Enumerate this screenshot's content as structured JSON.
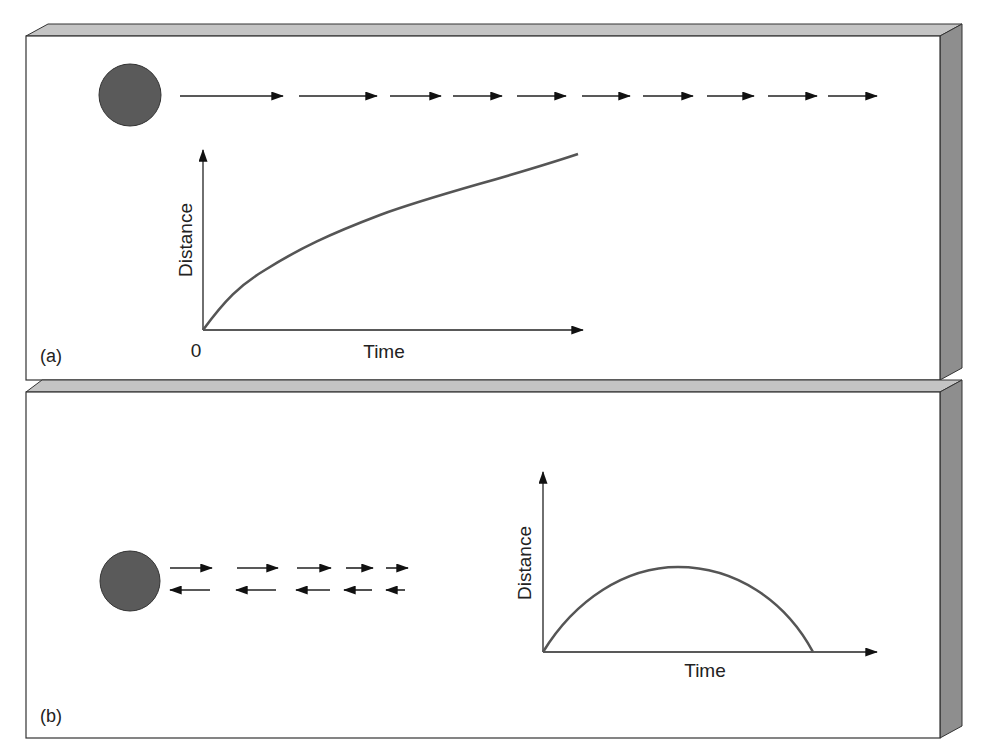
{
  "figure": {
    "panels": [
      {
        "id": "a",
        "label": "(a)",
        "ball_color": "#5a5a5a",
        "arrow_direction": "right",
        "arrows_right": [
          [
            180,
            283
          ],
          [
            299,
            377
          ],
          [
            390,
            441
          ],
          [
            453,
            502
          ],
          [
            517,
            566
          ],
          [
            582,
            630
          ],
          [
            643,
            693
          ],
          [
            707,
            754
          ],
          [
            768,
            817
          ],
          [
            828,
            877
          ]
        ],
        "graph": {
          "ylabel": "Distance",
          "xlabel": "Time",
          "origin_label": "0"
        }
      },
      {
        "id": "b",
        "label": "(b)",
        "ball_color": "#5a5a5a",
        "arrows_right": [
          [
            170,
            212
          ],
          [
            237,
            278
          ],
          [
            297,
            331
          ],
          [
            346,
            373
          ],
          [
            386,
            408
          ]
        ],
        "arrows_left": [
          [
            170,
            210
          ],
          [
            236,
            276
          ],
          [
            296,
            330
          ],
          [
            344,
            372
          ],
          [
            386,
            405
          ]
        ],
        "graph": {
          "ylabel": "Distance",
          "xlabel": "Time"
        }
      }
    ]
  },
  "chart_data": [
    {
      "type": "line",
      "title": "(a) Object moving away, decelerating",
      "xlabel": "Time",
      "ylabel": "Distance",
      "x": [
        0,
        1,
        2,
        3,
        4,
        5,
        6,
        7,
        8,
        9,
        10
      ],
      "values": [
        0,
        3.1,
        4.3,
        5.2,
        6.0,
        6.7,
        7.4,
        8.0,
        8.7,
        9.4,
        10.0
      ],
      "x_origin_label": "0",
      "grid": false
    },
    {
      "type": "line",
      "title": "(b) Object moving away and returning",
      "xlabel": "Time",
      "ylabel": "Distance",
      "x": [
        0,
        1,
        2,
        3,
        4,
        5,
        6,
        7,
        8
      ],
      "values": [
        0,
        2.6,
        4.4,
        5.3,
        5.5,
        5.3,
        4.4,
        2.6,
        0
      ],
      "grid": false
    }
  ]
}
